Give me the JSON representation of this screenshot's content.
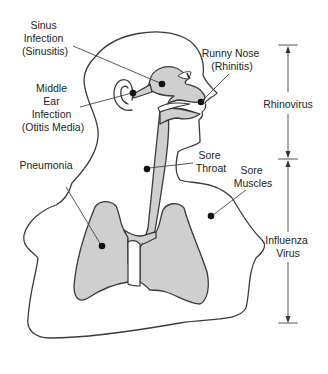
{
  "diagram": {
    "labels": {
      "sinus": [
        "Sinus",
        "Infection",
        "(Sinusitis)"
      ],
      "ear": [
        "Middle",
        "Ear",
        "Infection",
        "(Otitis Media)"
      ],
      "pneumonia": [
        "Pneumonia"
      ],
      "nose": [
        "Runny Nose",
        "(Rhinitis)"
      ],
      "throat": [
        "Sore",
        "Throat"
      ],
      "muscles": [
        "Sore",
        "Muscles"
      ]
    },
    "brackets": {
      "rhinovirus": [
        "Rhinovirus"
      ],
      "influenza": [
        "Influenza",
        "Virus"
      ]
    },
    "colors": {
      "organ_fill": "#cfcfcf",
      "outline": "#3a3a3a",
      "dot": "#111111"
    }
  }
}
